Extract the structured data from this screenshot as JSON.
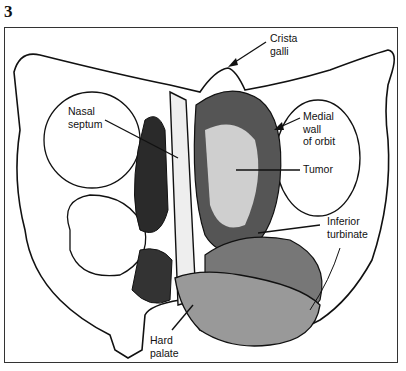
{
  "figure": {
    "number": "3",
    "labels": {
      "crista_galli": "Crista\ngalli",
      "nasal_septum": "Nasal\nseptum",
      "medial_wall_of_orbit": "Medial\nwall\nof orbit",
      "tumor": "Tumor",
      "inferior_turbinate": "Inferior\nturbinate",
      "hard_palate": "Hard\npalate"
    }
  }
}
